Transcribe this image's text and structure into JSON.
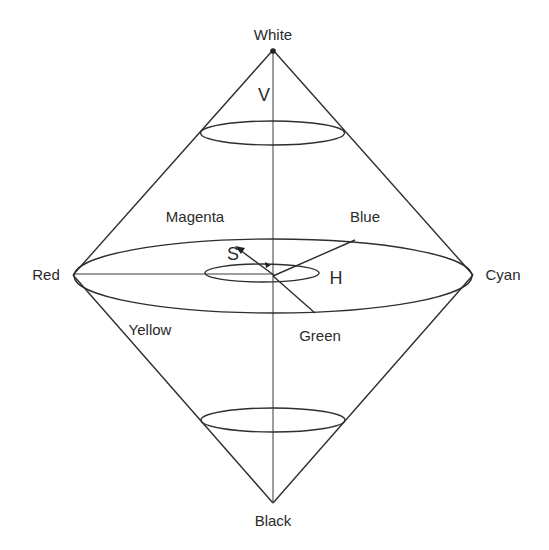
{
  "diagram": {
    "type": "hsv-double-cone",
    "labels": {
      "top": "White",
      "bottom": "Black",
      "left": "Red",
      "right": "Cyan",
      "upper_left": "Magenta",
      "upper_right": "Blue",
      "lower_left": "Yellow",
      "lower_right": "Green",
      "value_axis": "V",
      "saturation": "S",
      "hue": "H"
    },
    "colors": {
      "line": "#2e2e2e",
      "text": "#2a2a2a",
      "background": "#ffffff"
    }
  }
}
